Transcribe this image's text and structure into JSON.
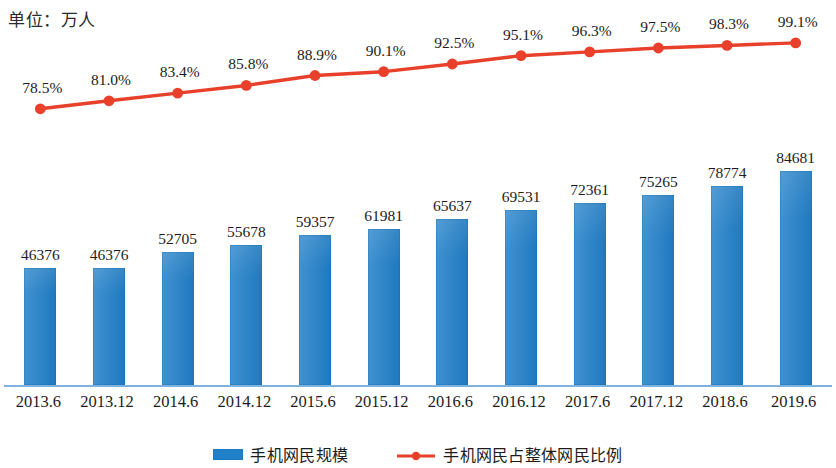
{
  "title": "单位：万人",
  "colors": {
    "bar": "#2180ca",
    "line": "#e8402a",
    "axis": "#7fb3df",
    "text": "#1c1c1c"
  },
  "legend": {
    "bar_label": "手机网民规模",
    "line_label": "手机网民占整体网民比例"
  },
  "chart_data": {
    "type": "bar",
    "title": "单位：万人",
    "xlabel": "",
    "ylabel": "万人",
    "grid": false,
    "legend_position": "bottom",
    "categories": [
      "2013.6",
      "2013.12",
      "2014.6",
      "2014.12",
      "2015.6",
      "2015.12",
      "2016.6",
      "2016.12",
      "2017.6",
      "2017.12",
      "2018.6",
      "2019.6"
    ],
    "series": [
      {
        "name": "手机网民规模",
        "type": "bar",
        "unit": "万人",
        "axis": "left",
        "values": [
          46376,
          46376,
          52705,
          55678,
          59357,
          61981,
          65637,
          69531,
          72361,
          75265,
          78774,
          84681
        ],
        "labels": [
          "46376",
          "46376",
          "52705",
          "55678",
          "59357",
          "61981",
          "65637",
          "69531",
          "72361",
          "75265",
          "78774",
          "84681"
        ],
        "ylim": [
          0,
          92000
        ]
      },
      {
        "name": "手机网民占整体网民比例",
        "type": "line",
        "unit": "%",
        "axis": "right",
        "values": [
          78.5,
          81.0,
          83.4,
          85.8,
          88.9,
          90.1,
          92.5,
          95.1,
          96.3,
          97.5,
          98.3,
          99.1
        ],
        "labels": [
          "78.5%",
          "81.0%",
          "83.4%",
          "85.8%",
          "88.9%",
          "90.1%",
          "92.5%",
          "95.1%",
          "96.3%",
          "97.5%",
          "98.3%",
          "99.1%"
        ],
        "ylim": [
          75,
          100
        ]
      }
    ]
  }
}
